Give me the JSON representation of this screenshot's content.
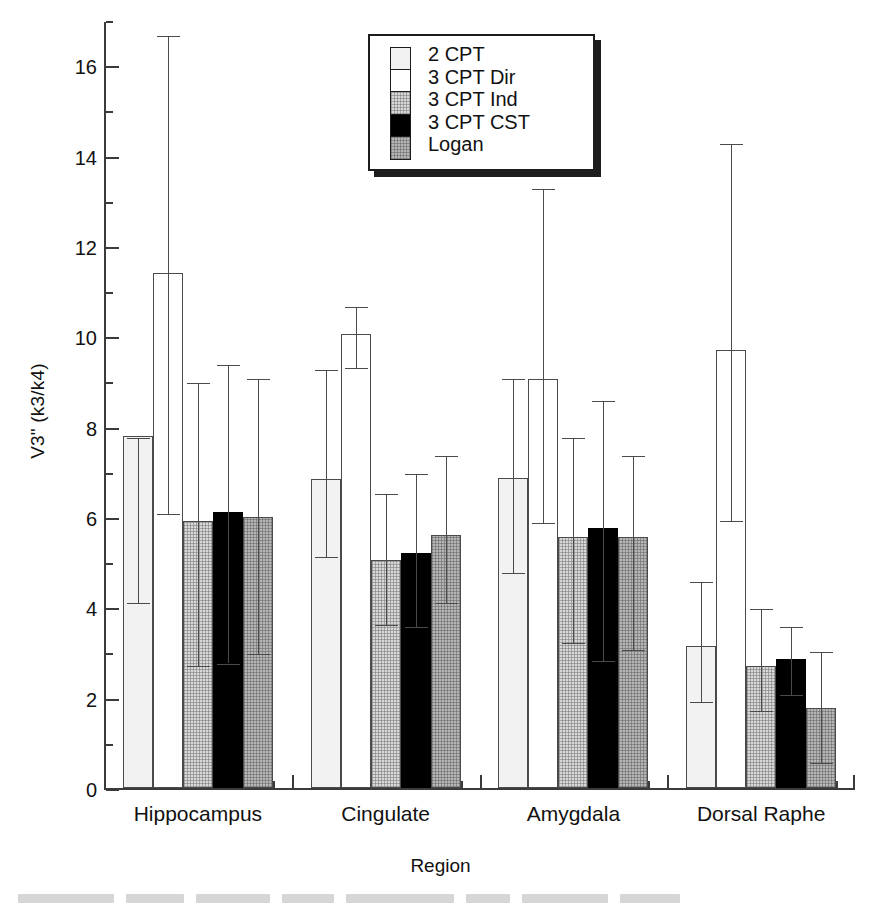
{
  "chart_data": {
    "type": "bar",
    "title": "",
    "xlabel": "Region",
    "ylabel": "V3\" (k3/k4)",
    "categories": [
      "Hippocampus",
      "Cingulate",
      "Amygdala",
      "Dorsal Raphe"
    ],
    "ylim": [
      0,
      17
    ],
    "ytick_step": 2,
    "yminor_step": 1,
    "ytick_labels": [
      "0",
      "2",
      "4",
      "6",
      "8",
      "10",
      "12",
      "14",
      "16"
    ],
    "grid": false,
    "legend_position": "top-center",
    "errorbars": "asymmetric (visible caps)",
    "series": [
      {
        "name": "2 CPT",
        "fill": "very-light-gray",
        "color": "#f2f2f2",
        "values": [
          7.8,
          6.85,
          6.87,
          3.15
        ],
        "err_upper": [
          7.8,
          9.3,
          9.1,
          4.6
        ],
        "err_lower": [
          4.15,
          5.15,
          4.8,
          1.95
        ]
      },
      {
        "name": "3 CPT Dir",
        "fill": "white",
        "color": "#ffffff",
        "values": [
          11.4,
          10.05,
          9.05,
          9.7
        ],
        "err_upper": [
          16.7,
          10.7,
          13.3,
          14.3
        ],
        "err_lower": [
          6.1,
          9.35,
          5.9,
          5.95
        ]
      },
      {
        "name": "3 CPT Ind",
        "fill": "light-gray-dotted",
        "color": "#d8d8d8",
        "values": [
          5.9,
          5.05,
          5.55,
          2.7
        ],
        "err_upper": [
          9.0,
          6.55,
          7.8,
          4.0
        ],
        "err_lower": [
          2.75,
          3.65,
          3.25,
          1.75
        ]
      },
      {
        "name": "3 CPT CST",
        "fill": "black",
        "color": "#000000",
        "values": [
          6.1,
          5.2,
          5.75,
          2.85
        ],
        "err_upper": [
          9.4,
          7.0,
          8.6,
          3.6
        ],
        "err_lower": [
          2.8,
          3.6,
          2.85,
          2.1
        ]
      },
      {
        "name": "Logan",
        "fill": "medium-gray-dotted",
        "color": "#b6b6b6",
        "values": [
          6.0,
          5.6,
          5.55,
          1.78
        ],
        "err_upper": [
          9.1,
          7.4,
          7.4,
          3.05
        ],
        "err_lower": [
          3.0,
          4.15,
          3.1,
          0.6
        ]
      }
    ]
  },
  "axis": {
    "y_label": "V3\" (k3/k4)",
    "x_label": "Region"
  },
  "legend": {
    "items": [
      {
        "label": "2 CPT",
        "swatch": "very-light-gray"
      },
      {
        "label": "3 CPT Dir",
        "swatch": "white"
      },
      {
        "label": "3 CPT Ind",
        "swatch": "light-gray-dotted"
      },
      {
        "label": "3 CPT CST",
        "swatch": "black"
      },
      {
        "label": "Logan",
        "swatch": "medium-gray-dotted"
      }
    ]
  }
}
